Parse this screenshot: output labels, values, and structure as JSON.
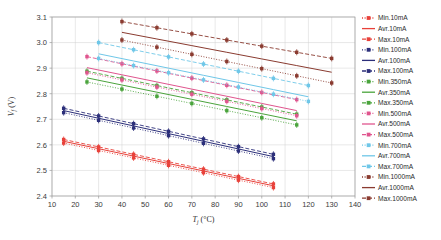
{
  "chart_data": {
    "type": "line",
    "title": "",
    "xlabel": "T_j (°C)",
    "ylabel": "V_f (V)",
    "xlim": [
      10,
      140
    ],
    "ylim": [
      2.4,
      3.1
    ],
    "xticks": [
      10,
      20,
      30,
      40,
      50,
      60,
      70,
      80,
      90,
      100,
      110,
      120,
      130,
      140
    ],
    "yticks": [
      "2.4",
      "2.5",
      "2.6",
      "2.7",
      "2.8",
      "2.9",
      "3.0",
      "3.1"
    ],
    "grid": true,
    "legend_position": "right-outside",
    "series": [
      {
        "name": "Min.10mA",
        "label": "Min.10mA",
        "color": "#e8413a",
        "style": "dotted",
        "marker": "square",
        "x": [
          15,
          30,
          45,
          60,
          75,
          90,
          105
        ],
        "values": [
          2.607,
          2.578,
          2.549,
          2.52,
          2.491,
          2.462,
          2.433
        ]
      },
      {
        "name": "Avr.10mA",
        "label": "Avr.10mA",
        "color": "#e8413a",
        "style": "solid",
        "marker": "none",
        "x": [
          15,
          30,
          45,
          60,
          75,
          90,
          105
        ],
        "values": [
          2.614,
          2.585,
          2.556,
          2.527,
          2.498,
          2.469,
          2.44
        ]
      },
      {
        "name": "Max.10mA",
        "label": "Max.10mA",
        "color": "#e8413a",
        "style": "dashed",
        "marker": "square",
        "x": [
          15,
          30,
          45,
          60,
          75,
          90,
          105
        ],
        "values": [
          2.621,
          2.592,
          2.563,
          2.534,
          2.505,
          2.476,
          2.447
        ]
      },
      {
        "name": "Min.100mA",
        "label": "Min.100mA",
        "color": "#2c2f7a",
        "style": "dotted",
        "marker": "square",
        "x": [
          15,
          30,
          45,
          60,
          75,
          90,
          105
        ],
        "values": [
          2.726,
          2.696,
          2.666,
          2.636,
          2.606,
          2.576,
          2.546
        ]
      },
      {
        "name": "Avr.100mA",
        "label": "Avr.100mA",
        "color": "#2c2f7a",
        "style": "solid",
        "marker": "none",
        "x": [
          15,
          30,
          45,
          60,
          75,
          90,
          105
        ],
        "values": [
          2.734,
          2.704,
          2.674,
          2.644,
          2.614,
          2.584,
          2.554
        ]
      },
      {
        "name": "Max.100mA",
        "label": "Max.100mA",
        "color": "#2c2f7a",
        "style": "dashed",
        "marker": "square",
        "x": [
          15,
          30,
          45,
          60,
          75,
          90,
          105
        ],
        "values": [
          2.743,
          2.713,
          2.683,
          2.653,
          2.623,
          2.593,
          2.563
        ]
      },
      {
        "name": "Min.350mA",
        "label": "Min.350mA",
        "color": "#4aa43c",
        "style": "dotted",
        "marker": "square",
        "x": [
          25,
          40,
          55,
          70,
          85,
          100,
          115
        ],
        "values": [
          2.846,
          2.818,
          2.79,
          2.762,
          2.734,
          2.706,
          2.678
        ]
      },
      {
        "name": "Avr.350mA",
        "label": "Avr.350mA",
        "color": "#4aa43c",
        "style": "solid",
        "marker": "none",
        "x": [
          25,
          40,
          55,
          70,
          85,
          100,
          115
        ],
        "values": [
          2.862,
          2.834,
          2.806,
          2.778,
          2.75,
          2.722,
          2.694
        ]
      },
      {
        "name": "Max.350mA",
        "label": "Max.350mA",
        "color": "#4aa43c",
        "style": "dashed",
        "marker": "square",
        "x": [
          25,
          40,
          55,
          70,
          85,
          100,
          115
        ],
        "values": [
          2.888,
          2.86,
          2.832,
          2.804,
          2.776,
          2.748,
          2.72
        ]
      },
      {
        "name": "Min.500mA",
        "label": "Min.500mA",
        "color": "#e0558e",
        "style": "dotted",
        "marker": "square",
        "x": [
          25,
          40,
          55,
          70,
          85,
          100,
          115
        ],
        "values": [
          2.882,
          2.854,
          2.826,
          2.798,
          2.77,
          2.742,
          2.714
        ]
      },
      {
        "name": "Avr.500mA",
        "label": "Avr.500mA",
        "color": "#e0558e",
        "style": "solid",
        "marker": "none",
        "x": [
          25,
          40,
          55,
          70,
          85,
          100,
          115
        ],
        "values": [
          2.902,
          2.874,
          2.846,
          2.818,
          2.79,
          2.762,
          2.734
        ]
      },
      {
        "name": "Max.500mA",
        "label": "Max.500mA",
        "color": "#e0558e",
        "style": "dashed",
        "marker": "square",
        "x": [
          25,
          40,
          55,
          70,
          85,
          100,
          115
        ],
        "values": [
          2.945,
          2.917,
          2.889,
          2.861,
          2.833,
          2.805,
          2.777
        ]
      },
      {
        "name": "Min.700mA",
        "label": "Min.700mA",
        "color": "#6fc7e8",
        "style": "dotted",
        "marker": "square",
        "x": [
          30,
          45,
          60,
          75,
          90,
          105,
          120
        ],
        "values": [
          2.938,
          2.91,
          2.882,
          2.854,
          2.826,
          2.798,
          2.77
        ]
      },
      {
        "name": "Avr.700mA",
        "label": "Avr.700mA",
        "color": "#6fc7e8",
        "style": "solid",
        "marker": "none",
        "x": [
          30,
          45,
          60,
          75,
          90,
          105,
          120
        ],
        "values": [
          2.956,
          2.928,
          2.9,
          2.872,
          2.844,
          2.816,
          2.788
        ]
      },
      {
        "name": "Max.700mA",
        "label": "Max.700mA",
        "color": "#6fc7e8",
        "style": "dashed",
        "marker": "square",
        "x": [
          30,
          45,
          60,
          75,
          90,
          105,
          120
        ],
        "values": [
          3.0,
          2.972,
          2.944,
          2.916,
          2.888,
          2.86,
          2.832
        ]
      },
      {
        "name": "Min.1000mA",
        "label": "Min.1000mA",
        "color": "#8a3b30",
        "style": "dotted",
        "marker": "square",
        "x": [
          40,
          55,
          70,
          85,
          100,
          115,
          130
        ],
        "values": [
          3.01,
          2.982,
          2.954,
          2.926,
          2.898,
          2.87,
          2.842
        ]
      },
      {
        "name": "Avr.1000mA",
        "label": "Avr.1000mA",
        "color": "#8a3b30",
        "style": "solid",
        "marker": "none",
        "x": [
          40,
          55,
          70,
          85,
          100,
          115,
          130
        ],
        "values": [
          3.04,
          3.014,
          2.988,
          2.962,
          2.936,
          2.91,
          2.884
        ]
      },
      {
        "name": "Max.1000mA",
        "label": "Max.1000mA",
        "color": "#8a3b30",
        "style": "dashed",
        "marker": "square",
        "x": [
          40,
          55,
          70,
          85,
          100,
          115,
          130
        ],
        "values": [
          3.082,
          3.058,
          3.034,
          3.01,
          2.986,
          2.962,
          2.938
        ]
      }
    ]
  }
}
